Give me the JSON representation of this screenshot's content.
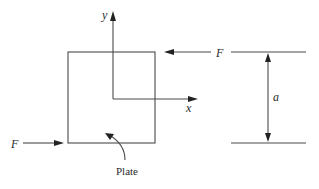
{
  "diagram": {
    "type": "free-body diagram",
    "colors": {
      "line": "#4a4a4a",
      "text": "#2a2a2a",
      "background": "#ffffff"
    },
    "labels": {
      "y_axis": "y",
      "x_axis": "x",
      "force_top": "F",
      "force_bottom": "F",
      "dimension": "a",
      "plate": "Plate"
    },
    "elements": [
      {
        "id": "plate",
        "shape": "square",
        "label": "Plate"
      },
      {
        "id": "x-axis",
        "direction": "right",
        "label": "x"
      },
      {
        "id": "y-axis",
        "direction": "up",
        "label": "y"
      },
      {
        "id": "force-top",
        "direction": "left",
        "label": "F",
        "applied_at": "top edge"
      },
      {
        "id": "force-bottom",
        "direction": "right",
        "label": "F",
        "applied_at": "bottom edge"
      },
      {
        "id": "dimension-a",
        "spans": "top edge to bottom edge",
        "label": "a"
      }
    ]
  }
}
